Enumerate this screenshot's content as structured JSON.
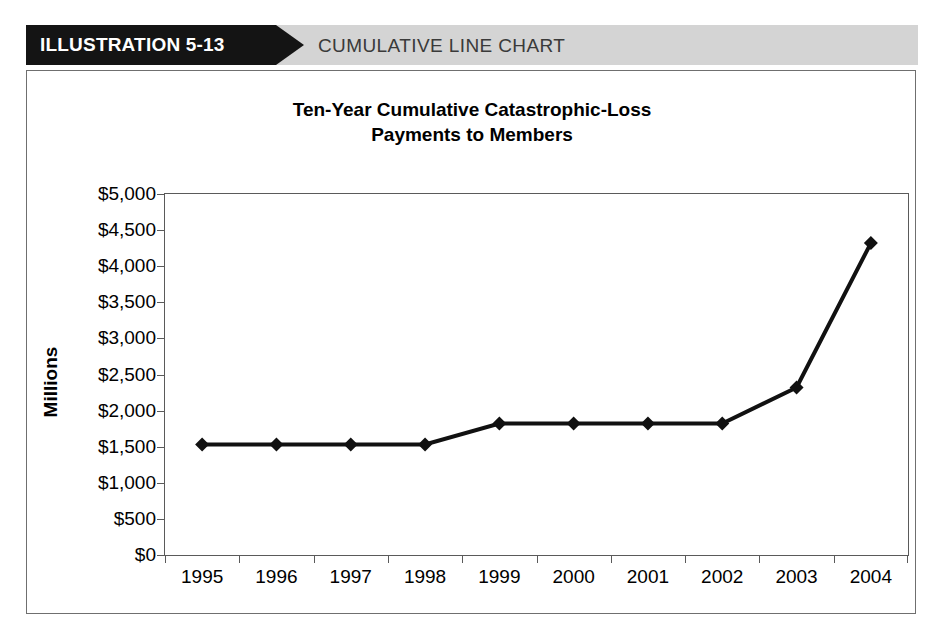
{
  "banner": {
    "label": "ILLUSTRATION 5-13",
    "title": "CUMULATIVE LINE CHART",
    "label_bg": "#141414",
    "label_color": "#ffffff",
    "title_bg": "#d4d4d4",
    "title_color": "#3a3a3a"
  },
  "chart_data": {
    "type": "line",
    "title": "Ten-Year Cumulative Catastrophic-Loss Payments to Members",
    "title_line1": "Ten-Year Cumulative Catastrophic-Loss",
    "title_line2": "Payments to Members",
    "xlabel": "",
    "ylabel": "Millions",
    "categories": [
      "1995",
      "1996",
      "1997",
      "1998",
      "1999",
      "2000",
      "2001",
      "2002",
      "2003",
      "2004"
    ],
    "values": [
      1530,
      1530,
      1530,
      1530,
      1820,
      1820,
      1820,
      1820,
      2320,
      4320
    ],
    "series": [
      {
        "name": "Cumulative Catastrophic-Loss Payments",
        "values": [
          1530,
          1530,
          1530,
          1530,
          1820,
          1820,
          1820,
          1820,
          2320,
          4320
        ]
      }
    ],
    "ylim": [
      0,
      5000
    ],
    "ytick_values": [
      0,
      500,
      1000,
      1500,
      2000,
      2500,
      3000,
      3500,
      4000,
      4500,
      5000
    ],
    "ytick_labels": [
      "$0",
      "$500",
      "$1,000",
      "$1,500",
      "$2,000",
      "$2,500",
      "$3,000",
      "$3,500",
      "$4,000",
      "$4,500",
      "$5,000"
    ],
    "grid": false,
    "legend": false,
    "legend_position": "none",
    "line_color": "#111111",
    "marker": "diamond",
    "marker_color": "#111111",
    "line_width": 4
  }
}
